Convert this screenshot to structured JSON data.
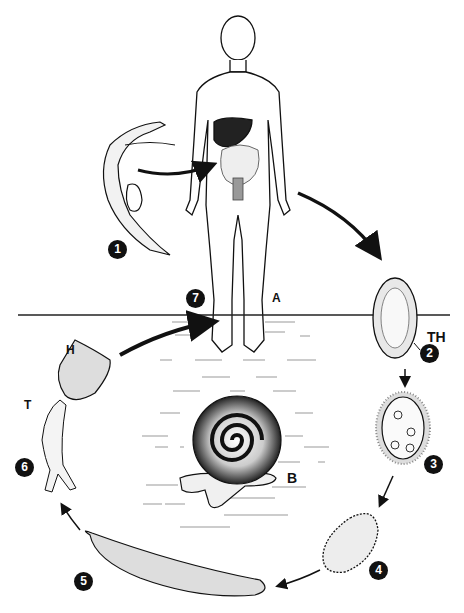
{
  "diagram": {
    "stages": [
      {
        "number": "1",
        "name": "adult-worm-pair"
      },
      {
        "number": "2",
        "name": "egg"
      },
      {
        "number": "3",
        "name": "miracidium"
      },
      {
        "number": "4",
        "name": "sporocyst"
      },
      {
        "number": "5",
        "name": "daughter-sporocyst"
      },
      {
        "number": "6",
        "name": "cercaria"
      },
      {
        "number": "7",
        "name": "skin-penetration"
      }
    ],
    "labels": {
      "human_host": "A",
      "snail_host": "B",
      "thorn": "TH",
      "head": "H",
      "tail": "T"
    }
  }
}
